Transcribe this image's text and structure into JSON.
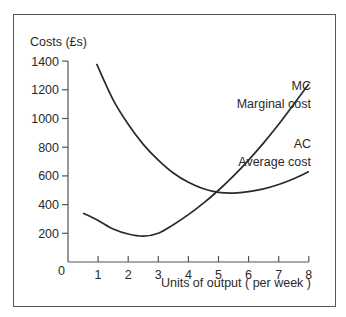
{
  "chart_data": {
    "type": "line",
    "title": "",
    "ylabel": "Costs (£s)",
    "xlabel": "Units of output ( per week )",
    "origin_label": "0",
    "xlim": [
      0,
      8
    ],
    "ylim": [
      0,
      1400
    ],
    "x_ticks": [
      1,
      2,
      3,
      4,
      5,
      6,
      7,
      8
    ],
    "x_tick_labels": [
      "1",
      "2",
      "3",
      "4",
      "5",
      "6",
      "7",
      "8"
    ],
    "y_ticks": [
      200,
      400,
      600,
      800,
      1000,
      1200,
      1400
    ],
    "y_tick_labels": [
      "200",
      "400",
      "600",
      "800",
      "1000",
      "1200",
      "1400"
    ],
    "grid": false,
    "legend": "inline labels at curve ends",
    "series": [
      {
        "name": "MC",
        "label_line1": "MC",
        "label_line2": "Marginal cost",
        "x": [
          0.5,
          1,
          1.5,
          2,
          2.5,
          3,
          3.5,
          4,
          4.5,
          5,
          5.5,
          6,
          6.5,
          7,
          7.5,
          8
        ],
        "values": [
          340,
          290,
          230,
          195,
          180,
          200,
          260,
          330,
          410,
          500,
          600,
          710,
          830,
          960,
          1100,
          1240
        ]
      },
      {
        "name": "AC",
        "label_line1": "AC",
        "label_line2": "Average cost",
        "x": [
          0.95,
          1.5,
          2,
          2.5,
          3,
          3.5,
          4,
          4.5,
          5,
          5.5,
          6,
          6.5,
          7,
          7.5,
          8
        ],
        "values": [
          1380,
          1130,
          960,
          820,
          710,
          620,
          555,
          510,
          485,
          480,
          490,
          510,
          540,
          580,
          630
        ]
      }
    ]
  }
}
